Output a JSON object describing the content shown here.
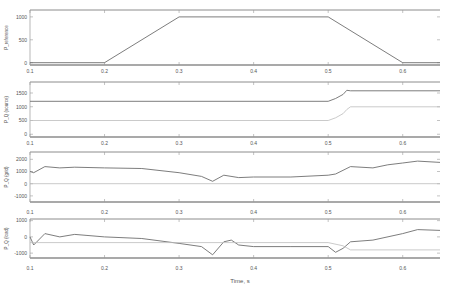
{
  "figure": {
    "xlabel": "Time, s",
    "xticks": [
      "0.1",
      "0.2",
      "0.3",
      "0.4",
      "0.5",
      "0.6"
    ],
    "xtick_values": [
      0.1,
      0.2,
      0.3,
      0.4,
      0.5,
      0.6
    ],
    "xlim": [
      0.1,
      0.65
    ]
  },
  "colors": {
    "axis": "#9a9a9a",
    "frame": "#8c8c8c",
    "series_primary": "#6e6e6e",
    "series_secondary": "#bdbdbd",
    "text": "#555555"
  },
  "chart_data": [
    {
      "type": "line",
      "title": "",
      "ylabel": "P_reference",
      "yticks": [
        "0",
        "500",
        "1000"
      ],
      "ylim": [
        -50,
        1150
      ],
      "grid": false,
      "series": [
        {
          "name": "P reference",
          "x": [
            0.1,
            0.2,
            0.3,
            0.5,
            0.6,
            0.65
          ],
          "values": [
            0,
            0,
            1000,
            1000,
            0,
            0
          ]
        }
      ]
    },
    {
      "type": "line",
      "title": "",
      "ylabel": "P_Q (source)",
      "yticks": [
        "0",
        "500",
        "1000",
        "1500"
      ],
      "ylim": [
        -100,
        1900
      ],
      "grid": false,
      "series": [
        {
          "name": "P",
          "x": [
            0.1,
            0.5,
            0.51,
            0.52,
            0.525,
            0.53,
            0.65
          ],
          "values": [
            1200,
            1200,
            1300,
            1450,
            1600,
            1580,
            1580
          ]
        },
        {
          "name": "Q",
          "x": [
            0.1,
            0.5,
            0.51,
            0.52,
            0.525,
            0.53,
            0.65
          ],
          "values": [
            500,
            500,
            600,
            750,
            900,
            1000,
            1000
          ]
        }
      ]
    },
    {
      "type": "line",
      "title": "",
      "ylabel": "P_Q (grid)",
      "yticks": [
        "-1000",
        "0",
        "1000",
        "2000"
      ],
      "ylim": [
        -1500,
        2600
      ],
      "grid": false,
      "series": [
        {
          "name": "P",
          "x": [
            0.1,
            0.105,
            0.12,
            0.14,
            0.16,
            0.2,
            0.25,
            0.3,
            0.33,
            0.345,
            0.36,
            0.38,
            0.4,
            0.45,
            0.5,
            0.51,
            0.53,
            0.56,
            0.58,
            0.6,
            0.62,
            0.65
          ],
          "values": [
            1000,
            900,
            1400,
            1300,
            1350,
            1300,
            1250,
            900,
            600,
            200,
            700,
            500,
            550,
            550,
            700,
            800,
            1400,
            1300,
            1550,
            1700,
            1850,
            1750
          ]
        },
        {
          "name": "Q",
          "x": [
            0.1,
            0.65
          ],
          "values": [
            0,
            0
          ]
        }
      ]
    },
    {
      "type": "line",
      "title": "",
      "ylabel": "P_Q (load)",
      "yticks": [
        "-1000",
        "0",
        "1000"
      ],
      "ylim": [
        -1300,
        1100
      ],
      "grid": false,
      "series": [
        {
          "name": "P",
          "x": [
            0.1,
            0.105,
            0.12,
            0.14,
            0.16,
            0.2,
            0.25,
            0.3,
            0.33,
            0.345,
            0.36,
            0.37,
            0.38,
            0.4,
            0.45,
            0.5,
            0.51,
            0.52,
            0.53,
            0.56,
            0.6,
            0.62,
            0.65
          ],
          "values": [
            0,
            -500,
            200,
            0,
            150,
            0,
            -100,
            -400,
            -600,
            -1100,
            -300,
            -200,
            -500,
            -600,
            -600,
            -600,
            -950,
            -700,
            -300,
            -200,
            200,
            450,
            400
          ]
        },
        {
          "name": "Q",
          "x": [
            0.1,
            0.5,
            0.52,
            0.53,
            0.65
          ],
          "values": [
            -350,
            -350,
            -550,
            -800,
            -800
          ]
        }
      ]
    }
  ]
}
